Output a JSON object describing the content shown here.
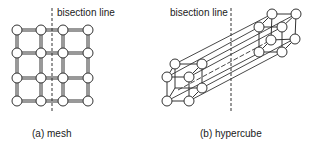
{
  "figure": {
    "panels": [
      {
        "id": "mesh",
        "caption": "(a) mesh",
        "bisection_label": "bisection line",
        "rows": 4,
        "cols": 4
      },
      {
        "id": "hypercube",
        "caption": "(b) hypercube",
        "bisection_label": "bisection line",
        "description": "two 3-cubes connected by 8 parallel links"
      }
    ],
    "colors": {
      "line": "#1a1a1a",
      "node_fill": "#ffffff",
      "background": "#ffffff"
    }
  }
}
